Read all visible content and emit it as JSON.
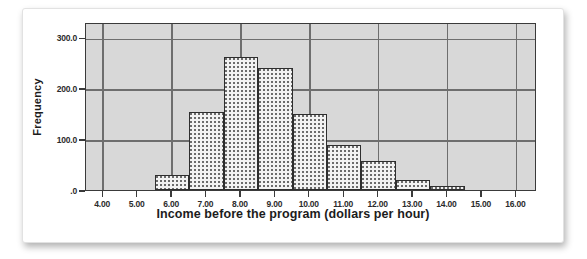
{
  "figure": {
    "background_color": "#ffffff",
    "plot_background_color": "#d8d8d8",
    "frame_color": "#3a3a3a",
    "grid_color": "#6e6e6e",
    "bar_fill_color": "#f2f2f2",
    "bar_edge_color": "#2e2e2e",
    "bar_pattern": "dotted-stipple"
  },
  "chart_data": {
    "type": "bar",
    "title": "",
    "subtitle": "",
    "xlabel": "Income before the program (dollars per hour)",
    "ylabel": "Frequency",
    "xlim": [
      3.5,
      16.6
    ],
    "ylim": [
      0,
      330
    ],
    "grid": true,
    "legend": null,
    "legend_position": "none",
    "bin_width": 1.0,
    "xtick_labels": [
      "4.00",
      "5.00",
      "6.00",
      "7.00",
      "8.00",
      "9.00",
      "10.00",
      "11.00",
      "12.00",
      "13.00",
      "14.00",
      "15.00",
      "16.00"
    ],
    "xtick_values": [
      4,
      5,
      6,
      7,
      8,
      9,
      10,
      11,
      12,
      13,
      14,
      15,
      16
    ],
    "ytick_labels": [
      "300.0",
      "200.0",
      "100.0",
      ".0"
    ],
    "ytick_values": [
      300,
      200,
      100,
      0
    ],
    "bin_edges": [
      5.5,
      6.5,
      7.5,
      8.5,
      9.5,
      10.5,
      11.5,
      12.5,
      13.5,
      14.5
    ],
    "bin_centers": [
      6.0,
      7.0,
      8.0,
      9.0,
      10.0,
      11.0,
      12.0,
      13.0,
      14.0
    ],
    "categories": [
      "5.5-6.5",
      "6.5-7.5",
      "7.5-8.5",
      "8.5-9.5",
      "9.5-10.5",
      "10.5-11.5",
      "11.5-12.5",
      "12.5-13.5",
      "13.5-14.5"
    ],
    "values": [
      29,
      153,
      262,
      239,
      149,
      88,
      57,
      20,
      7
    ]
  }
}
